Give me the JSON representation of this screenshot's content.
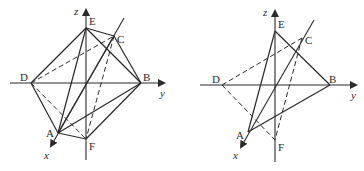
{
  "figures": [
    {
      "name": "octahedron-full",
      "axes": {
        "x": "x",
        "y": "y",
        "z": "z"
      },
      "vertices": {
        "A": "A",
        "B": "B",
        "C": "C",
        "D": "D",
        "E": "E",
        "F": "F"
      }
    },
    {
      "name": "octahedron-partial",
      "axes": {
        "x": "x",
        "y": "y",
        "z": "z"
      },
      "vertices": {
        "A": "A",
        "B": "B",
        "C": "C",
        "D": "D",
        "E": "E",
        "F": "F"
      }
    }
  ],
  "colors": {
    "stroke": "#2a2a2a",
    "background": "#ffffff"
  }
}
